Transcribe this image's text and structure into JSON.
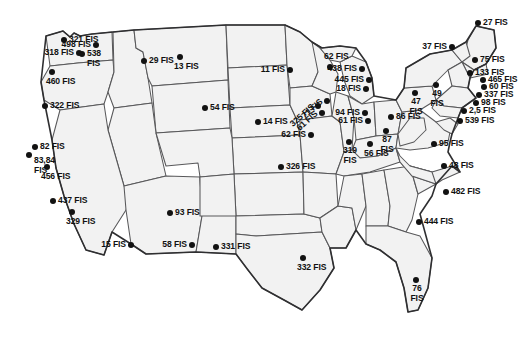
{
  "figure": {
    "type": "map",
    "region": "Continental United States",
    "label_suffix": "FIS",
    "marker_count": 44,
    "colors": {
      "land": "#f2f2f2",
      "state_border": "#58585a",
      "national_outline": "#2f2f31",
      "marker": "#121212",
      "label_text": "#111111",
      "background": "#ffffff"
    }
  },
  "markers": [
    {
      "id": "m01",
      "label": "321 FIS",
      "x": 64,
      "y": 40,
      "pos": "r"
    },
    {
      "id": "m02",
      "label": "498 FIS",
      "x": 96,
      "y": 45,
      "pos": "l"
    },
    {
      "id": "m03",
      "label": "318 FIS",
      "x": 79,
      "y": 53,
      "pos": "l"
    },
    {
      "id": "m04",
      "label": "538\nFIS",
      "x": 82,
      "y": 54,
      "pos": "r"
    },
    {
      "id": "m05",
      "label": "460 FIS",
      "x": 52,
      "y": 72,
      "pos": "b"
    },
    {
      "id": "m06",
      "label": "322 FIS",
      "x": 45,
      "y": 106,
      "pos": "r"
    },
    {
      "id": "m07",
      "label": "82 FIS",
      "x": 35,
      "y": 147,
      "pos": "r"
    },
    {
      "id": "m08",
      "label": "83,84\nFIS",
      "x": 29,
      "y": 155,
      "pos": "rb"
    },
    {
      "id": "m09",
      "label": "456 FIS",
      "x": 47,
      "y": 167,
      "pos": "b"
    },
    {
      "id": "m10",
      "label": "437 FIS",
      "x": 53,
      "y": 201,
      "pos": "r"
    },
    {
      "id": "m11",
      "label": "329 FIS",
      "x": 72,
      "y": 212,
      "pos": "b"
    },
    {
      "id": "m12",
      "label": "15 FIS",
      "x": 131,
      "y": 245,
      "pos": "l"
    },
    {
      "id": "m13",
      "label": "29 FIS",
      "x": 144,
      "y": 61,
      "pos": "r"
    },
    {
      "id": "m14",
      "label": "13 FIS",
      "x": 180,
      "y": 57,
      "pos": "b"
    },
    {
      "id": "m15",
      "label": "54 FIS",
      "x": 205,
      "y": 108,
      "pos": "r"
    },
    {
      "id": "m16",
      "label": "93 FIS",
      "x": 170,
      "y": 213,
      "pos": "r"
    },
    {
      "id": "m17",
      "label": "58 FIS",
      "x": 192,
      "y": 245,
      "pos": "l"
    },
    {
      "id": "m18",
      "label": "331 FIS",
      "x": 216,
      "y": 247,
      "pos": "r"
    },
    {
      "id": "m19",
      "label": "11 FIS",
      "x": 290,
      "y": 70,
      "pos": "l"
    },
    {
      "id": "m20",
      "label": "62 FIS",
      "x": 330,
      "y": 67,
      "pos": "t"
    },
    {
      "id": "m21",
      "label": "14 FIS",
      "x": 258,
      "y": 122,
      "pos": "r"
    },
    {
      "id": "m22",
      "label": "325 FIS",
      "x": 318,
      "y": 106,
      "pos": "rot"
    },
    {
      "id": "m23",
      "label": "71 FIS",
      "x": 327,
      "y": 101,
      "pos": "rot"
    },
    {
      "id": "m24",
      "label": "61 FIS",
      "x": 322,
      "y": 113,
      "pos": "rot"
    },
    {
      "id": "m25",
      "label": "62 FIS",
      "x": 311,
      "y": 135,
      "pos": "l"
    },
    {
      "id": "m26",
      "label": "326 FIS",
      "x": 281,
      "y": 167,
      "pos": "r"
    },
    {
      "id": "m27",
      "label": "438 FIS",
      "x": 362,
      "y": 69,
      "pos": "l"
    },
    {
      "id": "m28",
      "label": "445 FIS",
      "x": 369,
      "y": 80,
      "pos": "l"
    },
    {
      "id": "m29",
      "label": "18 FIS",
      "x": 366,
      "y": 89,
      "pos": "l"
    },
    {
      "id": "m30",
      "label": "94 FIS",
      "x": 365,
      "y": 113,
      "pos": "l"
    },
    {
      "id": "m31",
      "label": "61 FIS",
      "x": 368,
      "y": 121,
      "pos": "l"
    },
    {
      "id": "m32",
      "label": "319\nFIS",
      "x": 349,
      "y": 142,
      "pos": "ctr-b"
    },
    {
      "id": "m33",
      "label": "56 FIS",
      "x": 370,
      "y": 144,
      "pos": "b"
    },
    {
      "id": "m34",
      "label": "87\nFIS",
      "x": 386,
      "y": 131,
      "pos": "ctr-b"
    },
    {
      "id": "m35",
      "label": "86 FIS",
      "x": 391,
      "y": 117,
      "pos": "r"
    },
    {
      "id": "m36",
      "label": "47\nFIS",
      "x": 415,
      "y": 93,
      "pos": "ctr-b"
    },
    {
      "id": "m37",
      "label": "49\nFIS",
      "x": 436,
      "y": 85,
      "pos": "ctr-b"
    },
    {
      "id": "m38",
      "label": "37 FIS",
      "x": 452,
      "y": 47,
      "pos": "l"
    },
    {
      "id": "m39",
      "label": "27 FIS",
      "x": 478,
      "y": 23,
      "pos": "r"
    },
    {
      "id": "m40",
      "label": "75 FIS",
      "x": 475,
      "y": 60,
      "pos": "r"
    },
    {
      "id": "m41",
      "label": "133 FIS",
      "x": 470,
      "y": 73,
      "pos": "r"
    },
    {
      "id": "m42",
      "label": "465 FIS",
      "x": 483,
      "y": 80,
      "pos": "r"
    },
    {
      "id": "m43",
      "label": "60 FIS",
      "x": 484,
      "y": 87,
      "pos": "r"
    },
    {
      "id": "m44",
      "label": "337 FIS",
      "x": 479,
      "y": 95,
      "pos": "r"
    },
    {
      "id": "m45",
      "label": "98 FIS",
      "x": 476,
      "y": 103,
      "pos": "r"
    },
    {
      "id": "m46",
      "label": "2,5 FIS",
      "x": 464,
      "y": 111,
      "pos": "r"
    },
    {
      "id": "m47",
      "label": "539 FIS",
      "x": 460,
      "y": 121,
      "pos": "r"
    },
    {
      "id": "m48",
      "label": "95 FIS",
      "x": 434,
      "y": 144,
      "pos": "r"
    },
    {
      "id": "m49",
      "label": "48 FIS",
      "x": 444,
      "y": 166,
      "pos": "r"
    },
    {
      "id": "m50",
      "label": "482 FIS",
      "x": 446,
      "y": 192,
      "pos": "r"
    },
    {
      "id": "m51",
      "label": "444 FIS",
      "x": 419,
      "y": 222,
      "pos": "r"
    },
    {
      "id": "m52",
      "label": "76\nFIS",
      "x": 416,
      "y": 280,
      "pos": "ctr-b"
    },
    {
      "id": "m53",
      "label": "332 FIS",
      "x": 303,
      "y": 258,
      "pos": "b"
    }
  ]
}
